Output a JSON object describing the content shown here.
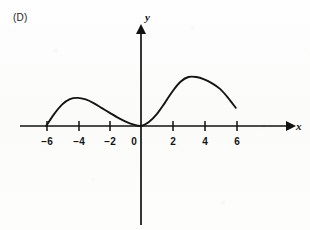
{
  "figure": {
    "option_label": "(D)",
    "axis_x_name": "x",
    "axis_y_name": "y"
  },
  "chart_data": {
    "type": "line",
    "title": "",
    "xlabel": "x",
    "ylabel": "y",
    "grid": false,
    "legend": "none",
    "xlim": [
      -7.6,
      9.4
    ],
    "ylim": [
      -6.3,
      6.3
    ],
    "xticks": [
      -6,
      -4,
      -2,
      0,
      2,
      4,
      6
    ],
    "xticklabels": [
      "−6",
      "−4",
      "−2",
      "0",
      "2",
      "4",
      "6"
    ],
    "yticks": [],
    "yticklabels": [],
    "series": [
      {
        "name": "curve",
        "x": [
          -6.0,
          -5.5,
          -5.0,
          -4.5,
          -4.0,
          -3.5,
          -3.0,
          -2.5,
          -2.0,
          -1.5,
          -1.0,
          -0.5,
          0.0,
          0.5,
          1.0,
          1.5,
          2.0,
          2.5,
          3.0,
          3.5,
          4.0,
          4.5,
          5.0,
          5.5,
          6.0
        ],
        "y": [
          0.0,
          0.75,
          1.35,
          1.7,
          1.78,
          1.68,
          1.45,
          1.15,
          0.85,
          0.55,
          0.3,
          0.1,
          0.0,
          0.25,
          0.75,
          1.45,
          2.2,
          2.8,
          3.1,
          3.1,
          2.95,
          2.7,
          2.35,
          1.8,
          1.15
        ]
      }
    ],
    "annotations": [
      {
        "text": "curve meets x-axis at x = -6",
        "x": -6,
        "y": 0
      },
      {
        "text": "local maximum near x = -4",
        "x": -4,
        "y": 1.78
      },
      {
        "text": "curve touches x-axis at origin",
        "x": 0,
        "y": 0
      },
      {
        "text": "local maximum near x = 3",
        "x": 3,
        "y": 3.1
      },
      {
        "text": "curve ends above axis at x = 6",
        "x": 6,
        "y": 1.15
      }
    ]
  },
  "colors": {
    "ink": "#141414",
    "background": "#fcfcfb"
  }
}
